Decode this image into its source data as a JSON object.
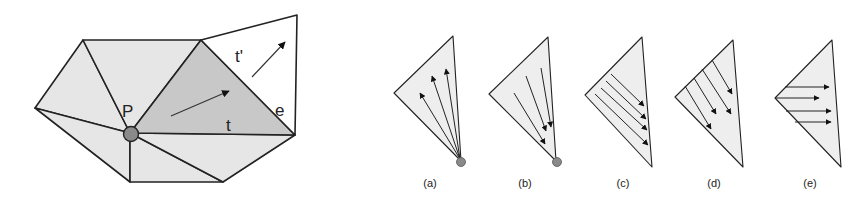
{
  "figure": {
    "left_panel": {
      "vertex_label": "P",
      "triangle_label": "t",
      "neighbor_triangle_label": "t'",
      "edge_label": "e",
      "colors": {
        "fan_fill": "#e6e6e6",
        "highlight_fill": "#c8c8c8",
        "neighbor_fill": "#ffffff",
        "vertex_dot": "#8a8a8a",
        "stroke": "#222222"
      }
    },
    "right_panel": {
      "cases": [
        {
          "caption": "(a)",
          "description": "flow diverging from vertex"
        },
        {
          "caption": "(b)",
          "description": "flow converging to vertex"
        },
        {
          "caption": "(c)",
          "description": "parallel flow along edge"
        },
        {
          "caption": "(d)",
          "description": "parallel flow downward"
        },
        {
          "caption": "(e)",
          "description": "parallel horizontal flow"
        }
      ]
    }
  }
}
